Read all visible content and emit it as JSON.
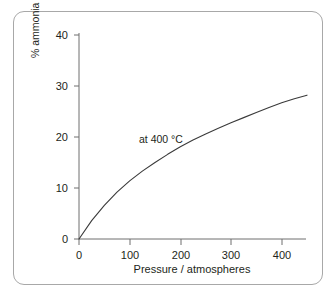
{
  "chart_data": {
    "type": "line",
    "title": "",
    "subtitle": "",
    "xlabel": "Pressure / atmospheres",
    "ylabel": "% ammonia at equilibrium",
    "xlim": [
      0,
      450
    ],
    "ylim": [
      0,
      42
    ],
    "xticks": [
      0,
      100,
      200,
      300,
      400
    ],
    "xtick_labels": [
      "0",
      "100",
      "200",
      "300",
      "400"
    ],
    "yticks": [
      0,
      10,
      20,
      30,
      40
    ],
    "ytick_labels": [
      "0",
      "10",
      "20",
      "30",
      "40"
    ],
    "grid": false,
    "legend": "none",
    "annotations": [
      {
        "text": "at 400 °C",
        "x": 120,
        "y": 19.8
      }
    ],
    "series": [
      {
        "name": "at 400 °C",
        "color": "#3a3a3a",
        "x": [
          0,
          25,
          50,
          75,
          100,
          125,
          150,
          175,
          200,
          225,
          250,
          275,
          300,
          325,
          350,
          375,
          400,
          425,
          450
        ],
        "y": [
          0,
          3.6,
          6.6,
          9.2,
          11.4,
          13.3,
          15.0,
          16.6,
          18.1,
          19.4,
          20.6,
          21.7,
          22.8,
          23.8,
          24.8,
          25.8,
          26.7,
          27.5,
          28.2
        ]
      }
    ]
  },
  "axes": {
    "x_title": "Pressure / atmospheres",
    "y_title": "% ammonia at equilibrium"
  },
  "colors": {
    "curve": "#3a3a3a",
    "axis": "#6e6e6e",
    "panel_border": "#a8a8a8",
    "text": "#231f20",
    "background": "#ffffff"
  }
}
